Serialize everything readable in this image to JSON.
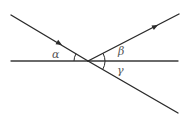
{
  "diagram": {
    "type": "ray-angle-diagram",
    "colors": {
      "line": "#2a2a2a",
      "label": "#555555",
      "background": "#ffffff"
    },
    "intersection": {
      "x": 88,
      "y": 61
    },
    "lines": [
      {
        "name": "horizontal-line",
        "from": [
          11,
          61
        ],
        "to": [
          178,
          61
        ],
        "arrow": false
      },
      {
        "name": "incident-ray",
        "from": [
          11,
          15
        ],
        "to": [
          88,
          61
        ],
        "arrow": true,
        "arrow_at": [
          60,
          44
        ]
      },
      {
        "name": "reflected-ray",
        "from": [
          88,
          61
        ],
        "to": [
          179,
          14
        ],
        "arrow": true,
        "arrow_at": [
          156,
          26
        ]
      },
      {
        "name": "through-ray",
        "from": [
          88,
          61
        ],
        "to": [
          178,
          113
        ],
        "arrow": false
      }
    ],
    "angles": [
      {
        "name": "alpha",
        "symbol": "α",
        "label_pos": [
          52,
          58
        ]
      },
      {
        "name": "beta",
        "symbol": "β",
        "label_pos": [
          118,
          55
        ]
      },
      {
        "name": "gamma",
        "symbol": "γ",
        "label_pos": [
          117,
          73
        ]
      }
    ]
  }
}
